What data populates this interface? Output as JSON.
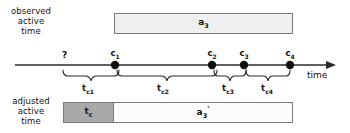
{
  "diagram": {
    "rows": {
      "observed": {
        "line1": "observed",
        "line2": "active",
        "line3": "time"
      },
      "adjusted": {
        "line1": "adjusted",
        "line2": "active",
        "line3": "time"
      }
    },
    "bars": {
      "observed": {
        "label": "a",
        "sub": "3",
        "fill": "#efefef",
        "stroke": "#7a7a7a"
      },
      "adjusted_tc": {
        "label": "t",
        "sub": "c",
        "fill": "#a9a9a9",
        "stroke": "#7a7a7a"
      },
      "adjusted_a3prime": {
        "label": "a",
        "sub": "3",
        "prime": "'",
        "fill": "#fbfbfb",
        "stroke": "#7a7a7a"
      }
    },
    "axis": {
      "axis_label": "time",
      "unknown_marker": "?",
      "ticks": [
        {
          "name": "c",
          "sub": "1",
          "x": 115
        },
        {
          "name": "c",
          "sub": "2",
          "x": 212
        },
        {
          "name": "c",
          "sub": "3",
          "x": 244
        },
        {
          "name": "c",
          "sub": "4",
          "x": 290
        }
      ],
      "intervals": [
        {
          "name": "t",
          "sub": "c1",
          "from": 63,
          "to": 115
        },
        {
          "name": "t",
          "sub": "c2",
          "from": 115,
          "to": 212
        },
        {
          "name": "t",
          "sub": "c3",
          "from": 212,
          "to": 244
        },
        {
          "name": "t",
          "sub": "c4",
          "from": 244,
          "to": 290
        }
      ]
    }
  }
}
